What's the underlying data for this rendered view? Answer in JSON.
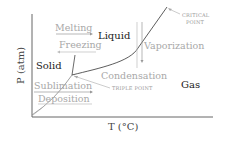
{
  "diagram": {
    "type": "phase-diagram",
    "axes": {
      "x_label": "T (°C)",
      "y_label": "P (atm)"
    },
    "phases": {
      "solid": "Solid",
      "liquid": "Liquid",
      "gas": "Gas"
    },
    "processes": {
      "melting": "Melting",
      "freezing": "Freezing",
      "vaporization": "Vaporization",
      "condensation": "Condensation",
      "sublimation": "Sublimation",
      "deposition": "Deposition"
    },
    "annotations": {
      "critical_point_line1": "CRITICAL",
      "critical_point_line2": "POINT",
      "triple_point": "TRIPLE POINT"
    },
    "colors": {
      "curve": "#333333",
      "axis": "#555555",
      "muted_text": "#a8a8a8",
      "dark_text": "#1a1a1a"
    }
  }
}
